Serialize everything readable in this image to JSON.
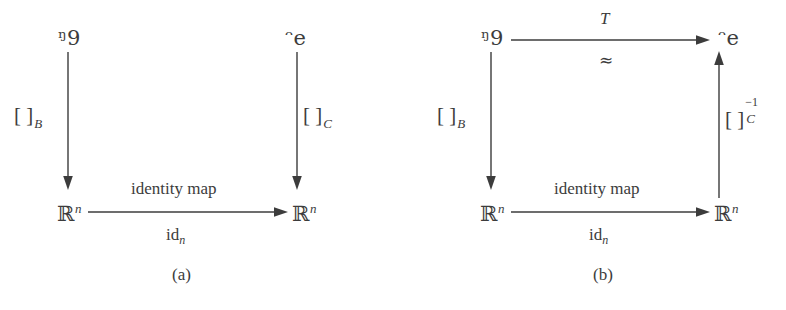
{
  "figure": {
    "type": "commutative-diagram-pair",
    "ink_color": "#3c3c3c",
    "background_color": "#ffffff",
    "panels": [
      {
        "id": "a",
        "caption": "(a)",
        "nodes": {
          "top_left": "ᵑ9",
          "top_right": "ᵔe",
          "bottom_left_base": "ℝ",
          "bottom_left_exp": "n",
          "bottom_right_base": "ℝ",
          "bottom_right_exp": "n"
        },
        "arrows": {
          "left_vertical": {
            "direction": "down",
            "label_bracket": "[ ]",
            "label_sub": "B",
            "label_sup": ""
          },
          "right_vertical": {
            "direction": "down",
            "label_bracket": "[ ]",
            "label_sub": "C",
            "label_sup": ""
          },
          "bottom_horizontal": {
            "direction": "right",
            "label_above": "identity map",
            "label_below_base": "id",
            "label_below_sub": "n"
          }
        }
      },
      {
        "id": "b",
        "caption": "(b)",
        "nodes": {
          "top_left": "ᵑ9",
          "top_right": "ᵔe",
          "bottom_left_base": "ℝ",
          "bottom_left_exp": "n",
          "bottom_right_base": "ℝ",
          "bottom_right_exp": "n"
        },
        "arrows": {
          "top_horizontal": {
            "direction": "right",
            "label_above": "T",
            "label_below": "≈"
          },
          "left_vertical": {
            "direction": "down",
            "label_bracket": "[ ]",
            "label_sub": "B",
            "label_sup": ""
          },
          "right_vertical": {
            "direction": "up",
            "label_bracket": "[ ]",
            "label_sub": "C",
            "label_sup": "−1"
          },
          "bottom_horizontal": {
            "direction": "right",
            "label_above": "identity map",
            "label_below_base": "id",
            "label_below_sub": "n"
          }
        }
      }
    ]
  }
}
